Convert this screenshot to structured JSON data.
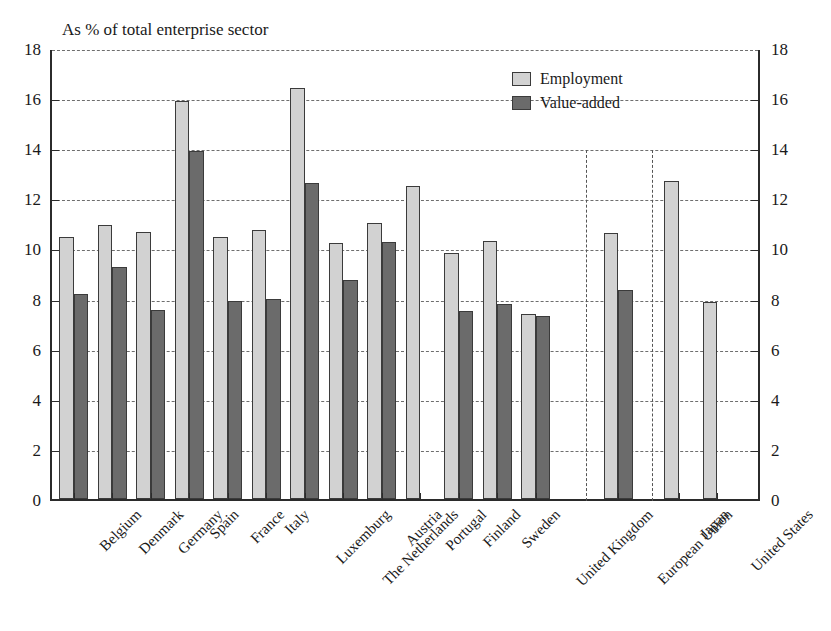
{
  "chart_data": {
    "type": "bar",
    "title": "As % of total enterprise sector",
    "xlabel": "",
    "ylabel": "",
    "ylim": [
      0,
      18
    ],
    "ytick_step": 2,
    "yticks": [
      "0",
      "2",
      "4",
      "6",
      "8",
      "10",
      "12",
      "14",
      "16",
      "18"
    ],
    "grid": true,
    "dual_y_axis": true,
    "legend_position": "top-right",
    "legend": [
      "Employment",
      "Value-added"
    ],
    "categories": [
      "Belgium",
      "Denmark",
      "Germany",
      "Spain",
      "France",
      "Italy",
      "Luxemburg",
      "The Netherlands",
      "Austria",
      "Portugal",
      "Finland",
      "Sweden",
      "United Kingdom",
      "European Union",
      "Japan",
      "United States"
    ],
    "series": [
      {
        "name": "Employment",
        "color": "#d2d2d2",
        "values": [
          10.45,
          10.95,
          10.65,
          15.9,
          10.45,
          10.75,
          16.4,
          10.2,
          11.0,
          12.5,
          9.8,
          10.3,
          7.4,
          10.6,
          12.7,
          7.85
        ]
      },
      {
        "name": "Value-added",
        "color": "#6b6b6b",
        "values": [
          8.2,
          9.25,
          7.55,
          13.9,
          7.9,
          8.0,
          12.6,
          8.75,
          10.25,
          null,
          7.5,
          7.8,
          7.3,
          8.35,
          null,
          null
        ]
      }
    ],
    "separator_groups": [
      {
        "after_category": "United Kingdom",
        "note": "dashed divider"
      },
      {
        "after_category": "European Union",
        "note": "dashed divider"
      }
    ]
  }
}
